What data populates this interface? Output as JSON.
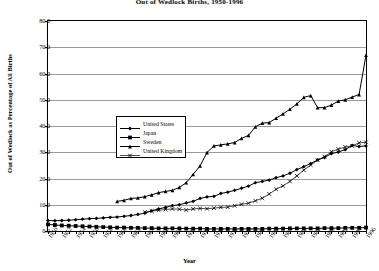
{
  "chart_data": {
    "type": "line",
    "title": "Out of Wedlock Births, 1950-1996",
    "xlabel": "Year",
    "ylabel": "Out of Wedlock as Percentage of All Births",
    "ylim": [
      0,
      80
    ],
    "yticks": [
      "0.0",
      "10.0",
      "20.0",
      "30.0",
      "40.0",
      "50.0",
      "60.0",
      "70.0",
      "80.0"
    ],
    "xlim": [
      1950,
      1996
    ],
    "xticks": [
      "1950",
      "1952",
      "1954",
      "1956",
      "1958",
      "1960",
      "1962",
      "1964",
      "1966",
      "1968",
      "1970",
      "1972",
      "1974",
      "1976",
      "1978",
      "1980",
      "1982",
      "1984",
      "1986",
      "1988",
      "1990",
      "1992",
      "1994",
      "1996"
    ],
    "grid": true,
    "legend_position": "upper-left-inside",
    "series": [
      {
        "name": "United States",
        "marker": "filled-diamond",
        "x": [
          1950,
          1951,
          1952,
          1953,
          1954,
          1955,
          1956,
          1957,
          1958,
          1959,
          1960,
          1961,
          1962,
          1963,
          1964,
          1965,
          1966,
          1967,
          1968,
          1969,
          1970,
          1971,
          1972,
          1973,
          1974,
          1975,
          1976,
          1977,
          1978,
          1979,
          1980,
          1981,
          1982,
          1983,
          1984,
          1985,
          1986,
          1987,
          1988,
          1989,
          1990,
          1991,
          1992,
          1993,
          1994,
          1995,
          1996
        ],
        "values": [
          4.0,
          3.9,
          4.0,
          4.1,
          4.3,
          4.5,
          4.7,
          4.8,
          5.0,
          5.2,
          5.3,
          5.6,
          5.9,
          6.3,
          6.8,
          7.7,
          8.4,
          9.0,
          9.7,
          10.0,
          10.7,
          11.3,
          12.4,
          13.0,
          13.2,
          14.3,
          14.8,
          15.5,
          16.3,
          17.1,
          18.4,
          18.9,
          19.4,
          20.3,
          21.0,
          22.0,
          23.4,
          24.5,
          25.7,
          27.1,
          28.0,
          29.5,
          30.1,
          31.0,
          32.6,
          32.2,
          32.4
        ]
      },
      {
        "name": "Japan",
        "marker": "filled-square",
        "x": [
          1950,
          1951,
          1952,
          1953,
          1954,
          1955,
          1956,
          1957,
          1958,
          1959,
          1960,
          1961,
          1962,
          1963,
          1964,
          1965,
          1966,
          1967,
          1968,
          1969,
          1970,
          1971,
          1972,
          1973,
          1974,
          1975,
          1976,
          1977,
          1978,
          1979,
          1980,
          1981,
          1982,
          1983,
          1984,
          1985,
          1986,
          1987,
          1988,
          1989,
          1990,
          1991,
          1992,
          1993,
          1994,
          1995,
          1996
        ],
        "values": [
          2.5,
          2.3,
          2.1,
          2.0,
          1.9,
          1.8,
          1.7,
          1.6,
          1.5,
          1.4,
          1.3,
          1.3,
          1.2,
          1.2,
          1.1,
          1.1,
          1.0,
          1.0,
          1.0,
          1.0,
          0.9,
          0.9,
          0.9,
          0.8,
          0.8,
          0.8,
          0.8,
          0.8,
          0.8,
          0.8,
          0.8,
          0.8,
          0.9,
          0.9,
          0.9,
          1.0,
          1.0,
          1.0,
          1.0,
          1.0,
          1.1,
          1.1,
          1.1,
          1.2,
          1.2,
          1.2,
          1.3
        ]
      },
      {
        "name": "Sweden",
        "marker": "filled-triangle",
        "x": [
          1960,
          1961,
          1962,
          1963,
          1964,
          1965,
          1966,
          1967,
          1968,
          1969,
          1970,
          1971,
          1972,
          1973,
          1974,
          1975,
          1976,
          1977,
          1978,
          1979,
          1980,
          1981,
          1982,
          1983,
          1984,
          1985,
          1986,
          1987,
          1988,
          1989,
          1990,
          1991,
          1992,
          1993,
          1994,
          1995,
          1996
        ],
        "values": [
          11.3,
          11.7,
          12.4,
          12.6,
          13.1,
          13.8,
          14.6,
          15.1,
          15.5,
          16.6,
          18.4,
          21.6,
          24.8,
          29.9,
          32.4,
          32.8,
          33.2,
          33.7,
          35.3,
          36.4,
          39.7,
          41.1,
          41.3,
          43.0,
          44.6,
          46.4,
          48.4,
          50.9,
          51.6,
          47.0,
          47.0,
          48.0,
          49.5,
          50.0,
          51.0,
          52.0,
          67.0
        ]
      },
      {
        "name": "United Kingdom",
        "marker": "cross-x",
        "x": [
          1964,
          1965,
          1966,
          1967,
          1968,
          1969,
          1970,
          1971,
          1972,
          1973,
          1974,
          1975,
          1976,
          1977,
          1978,
          1979,
          1980,
          1981,
          1982,
          1983,
          1984,
          1985,
          1986,
          1987,
          1988,
          1989,
          1990,
          1991,
          1992,
          1993,
          1994,
          1995,
          1996
        ],
        "values": [
          7.2,
          7.6,
          7.9,
          8.2,
          8.4,
          8.3,
          8.0,
          8.4,
          8.6,
          8.5,
          8.7,
          9.0,
          9.1,
          9.6,
          10.2,
          10.6,
          11.5,
          12.5,
          14.1,
          15.9,
          17.2,
          18.9,
          21.0,
          23.2,
          25.1,
          27.0,
          28.3,
          30.2,
          31.2,
          32.0,
          32.4,
          33.6,
          33.8
        ]
      }
    ]
  }
}
